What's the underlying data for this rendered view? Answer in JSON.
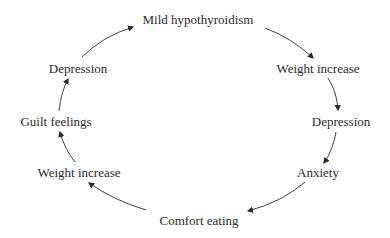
{
  "diagram": {
    "type": "cycle",
    "text_color": "#2a2a2a",
    "arrow_color": "#2a2a2a",
    "nodes": [
      {
        "id": "n0",
        "label": "Mild hypothyroidism",
        "x": 198,
        "y": 19
      },
      {
        "id": "n1",
        "label": "Weight increase",
        "x": 318,
        "y": 68
      },
      {
        "id": "n2",
        "label": "Depression",
        "x": 341,
        "y": 121
      },
      {
        "id": "n3",
        "label": "Anxiety",
        "x": 318,
        "y": 172
      },
      {
        "id": "n4",
        "label": "Comfort eating",
        "x": 199,
        "y": 220
      },
      {
        "id": "n5",
        "label": "Weight increase",
        "x": 79,
        "y": 172
      },
      {
        "id": "n6",
        "label": "Guilt feelings",
        "x": 56,
        "y": 121
      },
      {
        "id": "n7",
        "label": "Depression",
        "x": 78,
        "y": 68
      }
    ],
    "edges": [
      {
        "from": "n0",
        "to": "n1"
      },
      {
        "from": "n1",
        "to": "n2"
      },
      {
        "from": "n2",
        "to": "n3"
      },
      {
        "from": "n3",
        "to": "n4"
      },
      {
        "from": "n4",
        "to": "n5"
      },
      {
        "from": "n5",
        "to": "n6"
      },
      {
        "from": "n6",
        "to": "n7"
      },
      {
        "from": "n7",
        "to": "n0"
      }
    ]
  }
}
